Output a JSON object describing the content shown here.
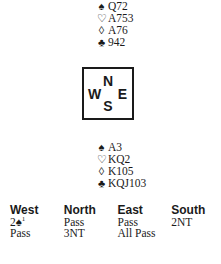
{
  "north": {
    "label": "North hand",
    "suits": [
      {
        "icon": "spade-icon",
        "symbol": "♠",
        "cards": "Q72"
      },
      {
        "icon": "heart-icon",
        "symbol": "♡",
        "cards": "A753"
      },
      {
        "icon": "diamond-icon",
        "symbol": "◊",
        "cards": "A76"
      },
      {
        "icon": "club-icon",
        "symbol": "♣",
        "cards": "942"
      }
    ]
  },
  "compass": {
    "n": "N",
    "w": "W",
    "e": "E",
    "s": "S"
  },
  "south": {
    "label": "South hand",
    "suits": [
      {
        "icon": "spade-icon",
        "symbol": "♠",
        "cards": "A3"
      },
      {
        "icon": "heart-icon",
        "symbol": "♡",
        "cards": "KQ2"
      },
      {
        "icon": "diamond-icon",
        "symbol": "◊",
        "cards": "K105"
      },
      {
        "icon": "club-icon",
        "symbol": "♣",
        "cards": "KQJ103"
      }
    ]
  },
  "auction": {
    "headers": [
      "West",
      "North",
      "East",
      "South"
    ],
    "rows": [
      [
        {
          "text": "2♠",
          "footnote": "1"
        },
        {
          "text": "Pass"
        },
        {
          "text": "Pass"
        },
        {
          "text": "2NT"
        }
      ],
      [
        {
          "text": "Pass"
        },
        {
          "text": "3NT"
        },
        {
          "text": "All Pass"
        },
        {
          "text": ""
        }
      ]
    ]
  }
}
